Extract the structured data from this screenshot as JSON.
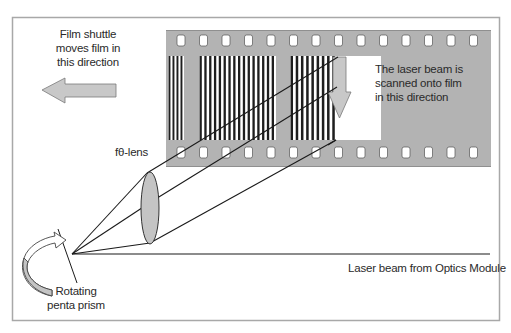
{
  "colors": {
    "frame": "#a8a8a8",
    "film": "#b3b3b3",
    "stripe": "#1e1e1e",
    "arrow_fill": "#c8c8c8",
    "arrow_stroke": "#7a7a7a",
    "beam": "#1a1a1a",
    "lens_fill": "#c4c4c4"
  },
  "labels": {
    "film_shuttle": [
      "Film shuttle",
      "moves film in",
      "this direction"
    ],
    "laser_scan": [
      "The laser beam is",
      "scanned onto film",
      "in this direction"
    ],
    "lens": "fθ-lens",
    "prism": [
      "Rotating",
      "penta prism"
    ],
    "beam_source": "Laser beam from Optics Module"
  },
  "film": {
    "sprocket_holes_per_row": 14,
    "exposed_blocks": [
      {
        "x_start": 168,
        "x_end": 184,
        "stripes": 4
      },
      {
        "x_start": 199,
        "x_end": 276,
        "stripes": 16
      },
      {
        "x_start": 290,
        "x_end": 337,
        "stripes": 9
      }
    ]
  }
}
